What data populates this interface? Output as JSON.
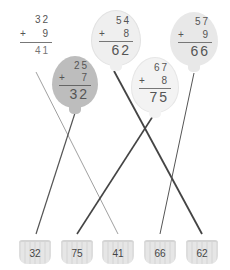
{
  "balloons": [
    {
      "id": "b1",
      "top": "32",
      "add": "9",
      "answer": "41",
      "color": "#ffffff",
      "shade": "none"
    },
    {
      "id": "b2",
      "top": "25",
      "add": "7",
      "answer": "32",
      "color": "#bdbdbd",
      "shade": "dark"
    },
    {
      "id": "b3",
      "top": "54",
      "add": "8",
      "answer": "62",
      "color": "#efefef",
      "shade": "light"
    },
    {
      "id": "b4",
      "top": "67",
      "add": "8",
      "answer": "75",
      "color": "#f3f3f3",
      "shade": "light"
    },
    {
      "id": "b5",
      "top": "57",
      "add": "9",
      "answer": "66",
      "color": "#e8e8e8",
      "shade": "light"
    }
  ],
  "operator": "+",
  "baskets": [
    {
      "label": "32"
    },
    {
      "label": "75"
    },
    {
      "label": "41"
    },
    {
      "label": "66"
    },
    {
      "label": "62"
    }
  ]
}
